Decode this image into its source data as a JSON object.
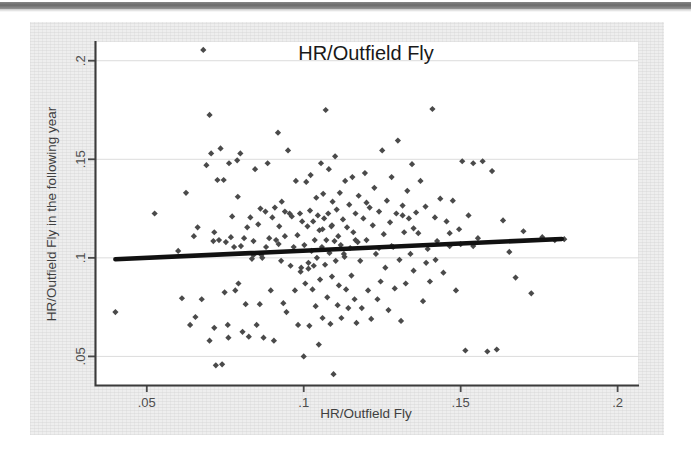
{
  "figure": {
    "background_color": "#eeeeee",
    "plot_background_color": "#ffffff",
    "marker_color": "#4a4a4a",
    "fitline_color": "#111111"
  },
  "chart_data": {
    "type": "scatter",
    "title": "HR/Outfield Fly",
    "xlabel": "HR/Outfield Fly",
    "ylabel": "HR/Outfield Fly in the following year",
    "xlim": [
      0.0335,
      0.2065
    ],
    "ylim": [
      0.0355,
      0.2095
    ],
    "xticks": [
      0.05,
      0.1,
      0.15,
      0.2
    ],
    "xtick_labels": [
      ".05",
      ".1",
      ".15",
      ".2"
    ],
    "yticks": [
      0.05,
      0.1,
      0.15,
      0.2
    ],
    "ytick_labels": [
      ".05",
      ".1",
      ".15",
      ".2"
    ],
    "grid": true,
    "legend": "none",
    "series": [
      {
        "name": "teams",
        "marker": "diamond",
        "x": [
          0.04,
          0.0525,
          0.06,
          0.0612,
          0.0625,
          0.0638,
          0.065,
          0.0655,
          0.0662,
          0.0675,
          0.069,
          0.07,
          0.07,
          0.0705,
          0.0712,
          0.0715,
          0.072,
          0.0725,
          0.073,
          0.0735,
          0.074,
          0.0745,
          0.0748,
          0.0752,
          0.0758,
          0.0762,
          0.0768,
          0.0772,
          0.0778,
          0.0782,
          0.0788,
          0.0792,
          0.0798,
          0.08,
          0.0805,
          0.081,
          0.0815,
          0.082,
          0.0825,
          0.083,
          0.0835,
          0.084,
          0.0845,
          0.085,
          0.0855,
          0.086,
          0.0862,
          0.0868,
          0.0872,
          0.0878,
          0.088,
          0.0885,
          0.089,
          0.0895,
          0.09,
          0.0905,
          0.0908,
          0.0912,
          0.0918,
          0.0922,
          0.0928,
          0.093,
          0.0935,
          0.094,
          0.0945,
          0.095,
          0.0955,
          0.0958,
          0.0962,
          0.0968,
          0.0972,
          0.0975,
          0.098,
          0.0982,
          0.0988,
          0.0992,
          0.0995,
          0.1,
          0.1002,
          0.1005,
          0.1008,
          0.1012,
          0.1015,
          0.1018,
          0.102,
          0.1022,
          0.1025,
          0.1028,
          0.103,
          0.1032,
          0.1035,
          0.1038,
          0.104,
          0.1042,
          0.1045,
          0.1048,
          0.105,
          0.1052,
          0.1055,
          0.1058,
          0.106,
          0.1062,
          0.1065,
          0.1068,
          0.107,
          0.1072,
          0.1075,
          0.1078,
          0.108,
          0.1082,
          0.1085,
          0.1088,
          0.109,
          0.1092,
          0.1095,
          0.1098,
          0.11,
          0.1102,
          0.1105,
          0.1108,
          0.111,
          0.1112,
          0.1115,
          0.1118,
          0.112,
          0.1125,
          0.1128,
          0.1132,
          0.1135,
          0.1138,
          0.1142,
          0.1145,
          0.1148,
          0.1152,
          0.1155,
          0.1158,
          0.1162,
          0.1165,
          0.1168,
          0.1172,
          0.1175,
          0.118,
          0.1185,
          0.119,
          0.1195,
          0.12,
          0.1205,
          0.121,
          0.1215,
          0.122,
          0.1225,
          0.123,
          0.1235,
          0.124,
          0.1245,
          0.125,
          0.1255,
          0.126,
          0.1265,
          0.127,
          0.1275,
          0.128,
          0.1285,
          0.129,
          0.1295,
          0.13,
          0.1305,
          0.131,
          0.1315,
          0.132,
          0.1325,
          0.133,
          0.1335,
          0.134,
          0.1345,
          0.135,
          0.1358,
          0.1365,
          0.1372,
          0.138,
          0.1388,
          0.1395,
          0.1402,
          0.141,
          0.1418,
          0.1425,
          0.1435,
          0.1445,
          0.1455,
          0.1465,
          0.1475,
          0.1485,
          0.1495,
          0.1505,
          0.1515,
          0.1525,
          0.154,
          0.1555,
          0.157,
          0.1585,
          0.16,
          0.1615,
          0.1635,
          0.1655,
          0.1675,
          0.17,
          0.1725,
          0.176,
          0.18,
          0.183,
          0.068,
          0.076,
          0.084,
          0.092,
          0.099,
          0.106,
          0.113,
          0.12,
          0.128,
          0.135,
          0.142,
          0.15,
          0.0715,
          0.079,
          0.0865,
          0.094,
          0.1015,
          0.109,
          0.1165,
          0.124,
          0.1315,
          0.139,
          0.1465,
          0.154
        ],
        "y": [
          0.0725,
          0.1225,
          0.1035,
          0.0795,
          0.133,
          0.066,
          0.111,
          0.07,
          0.1155,
          0.079,
          0.147,
          0.1725,
          0.058,
          0.153,
          0.1085,
          0.0645,
          0.0455,
          0.1395,
          0.109,
          0.1555,
          0.046,
          0.1395,
          0.0825,
          0.108,
          0.066,
          0.148,
          0.1105,
          0.121,
          0.1055,
          0.0835,
          0.1495,
          0.087,
          0.153,
          0.106,
          0.0625,
          0.11,
          0.0765,
          0.1155,
          0.06,
          0.1205,
          0.0995,
          0.1085,
          0.145,
          0.066,
          0.117,
          0.0765,
          0.125,
          0.1,
          0.0595,
          0.1235,
          0.1055,
          0.148,
          0.11,
          0.0835,
          0.1205,
          0.058,
          0.1255,
          0.109,
          0.1635,
          0.116,
          0.0985,
          0.1285,
          0.077,
          0.111,
          0.0725,
          0.1545,
          0.1225,
          0.096,
          0.121,
          0.1055,
          0.0835,
          0.139,
          0.1115,
          0.066,
          0.1225,
          0.095,
          0.1185,
          0.05,
          0.1065,
          0.087,
          0.1385,
          0.116,
          0.0975,
          0.0655,
          0.124,
          0.142,
          0.1035,
          0.084,
          0.1185,
          0.096,
          0.109,
          0.0755,
          0.1305,
          0.1,
          0.1215,
          0.056,
          0.114,
          0.089,
          0.148,
          0.1055,
          0.0695,
          0.1325,
          0.12,
          0.0965,
          0.175,
          0.109,
          0.08,
          0.1225,
          0.145,
          0.1025,
          0.0665,
          0.116,
          0.0905,
          0.1285,
          0.041,
          0.1085,
          0.1515,
          0.0985,
          0.1245,
          0.076,
          0.111,
          0.086,
          0.133,
          0.1065,
          0.0695,
          0.1195,
          0.102,
          0.139,
          0.084,
          0.1155,
          0.0745,
          0.127,
          0.105,
          0.091,
          0.141,
          0.113,
          0.079,
          0.1225,
          0.067,
          0.108,
          0.1315,
          0.0985,
          0.0745,
          0.12,
          0.143,
          0.109,
          0.0835,
          0.1255,
          0.069,
          0.1165,
          0.1355,
          0.102,
          0.079,
          0.1235,
          0.088,
          0.1545,
          0.112,
          0.095,
          0.129,
          0.0735,
          0.118,
          0.141,
          0.1055,
          0.0845,
          0.1225,
          0.1595,
          0.099,
          0.068,
          0.1265,
          0.113,
          0.087,
          0.134,
          0.12,
          0.102,
          0.1475,
          0.0935,
          0.123,
          0.1125,
          0.139,
          0.078,
          0.126,
          0.1045,
          0.088,
          0.1755,
          0.1205,
          0.1085,
          0.13,
          0.0925,
          0.1185,
          0.106,
          0.129,
          0.0835,
          0.1145,
          0.149,
          0.053,
          0.1215,
          0.148,
          0.11,
          0.149,
          0.0525,
          0.144,
          0.0535,
          0.119,
          0.103,
          0.09,
          0.1135,
          0.082,
          0.1105,
          0.109,
          0.1095,
          0.2055,
          0.0595,
          0.1015,
          0.107,
          0.093,
          0.1145,
          0.1005,
          0.128,
          0.106,
          0.115,
          0.099,
          0.107,
          0.113,
          0.131,
          0.1015,
          0.1235,
          0.0945,
          0.1165,
          0.109,
          0.105,
          0.1215,
          0.0975,
          0.1125,
          0.106
        ],
        "point_count": 238
      }
    ],
    "fit_line": {
      "name": "linear fit",
      "x_start": 0.04,
      "y_start": 0.0993,
      "x_end": 0.1822,
      "y_end": 0.1096,
      "slope": 0.0724,
      "intercept": 0.0964
    }
  }
}
